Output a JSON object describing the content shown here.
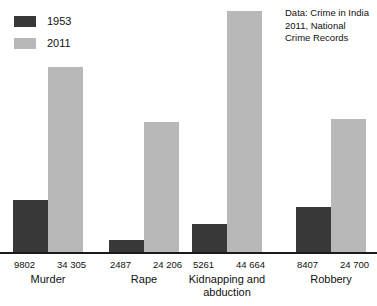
{
  "chart_data": {
    "type": "bar",
    "title": "",
    "subtitle": "",
    "xlabel": "",
    "ylabel": "",
    "grid": false,
    "legend_position": "top-left",
    "ylim": [
      0,
      44664
    ],
    "categories": [
      "Murder",
      "Rape",
      "Kidnapping and abduction",
      "Robbery"
    ],
    "series": [
      {
        "name": "1953",
        "color": "#383838",
        "values": [
          9802,
          5261,
          2487,
          8407
        ],
        "value_labels": [
          "9802",
          "2487",
          "5261",
          "8407"
        ]
      },
      {
        "name": "2011",
        "color": "#b8b8b8",
        "values": [
          34305,
          24206,
          44664,
          24700
        ],
        "value_labels": [
          "34 305",
          "24 206",
          "44 664",
          "24 700"
        ]
      }
    ],
    "series_ordered_values": {
      "1953": [
        9802,
        2487,
        5261,
        8407
      ],
      "2011": [
        34305,
        24206,
        44664,
        24700
      ]
    },
    "annotation": "Data: Crime in India 2011, National Crime Records"
  },
  "legend": {
    "items": [
      {
        "label": "1953",
        "color": "#383838"
      },
      {
        "label": "2011",
        "color": "#b8b8b8"
      }
    ]
  },
  "source_note": {
    "text": "Data: Crime in India 2011, National Crime Records"
  },
  "groups": [
    {
      "name": "Murder",
      "v1953": "9802",
      "v2011": "34 305"
    },
    {
      "name": "Rape",
      "v1953": "2487",
      "v2011": "24 206"
    },
    {
      "name": "Kidnapping and abduction",
      "v1953": "5261",
      "v2011": "44 664"
    },
    {
      "name": "Robbery",
      "v1953": "8407",
      "v2011": "24 700"
    }
  ],
  "axis": {
    "baseline_color": "#1a1a1a"
  }
}
